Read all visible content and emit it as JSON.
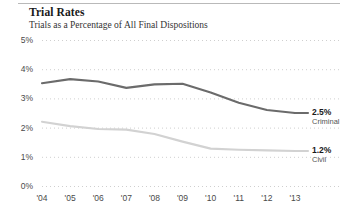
{
  "chart_data": {
    "type": "line",
    "title": "Trial Rates",
    "subtitle": "Trials as a Percentage of All Final Dispositions",
    "xlabel": "",
    "ylabel": "",
    "x": [
      "'04",
      "'05",
      "'06",
      "'07",
      "'08",
      "'09",
      "'10",
      "'11",
      "'12",
      "'13"
    ],
    "categories": [
      "'04",
      "'05",
      "'06",
      "'07",
      "'08",
      "'09",
      "'10",
      "'11",
      "'12",
      "'13"
    ],
    "ylim": [
      0,
      5
    ],
    "yticks": [
      0,
      1,
      2,
      3,
      4,
      5
    ],
    "ytick_labels": [
      "0%",
      "1%",
      "2%",
      "3%",
      "4%",
      "5%"
    ],
    "grid": true,
    "grid_style": "dotted",
    "legend_position": "right-inline",
    "series": [
      {
        "name": "Criminal",
        "color": "#6b6b6b",
        "end_value_label": "2.5%",
        "values": [
          3.52,
          3.66,
          3.58,
          3.36,
          3.48,
          3.5,
          3.2,
          2.85,
          2.6,
          2.5
        ]
      },
      {
        "name": "Civil",
        "color": "#d2d2d2",
        "end_value_label": "1.2%",
        "values": [
          2.2,
          2.05,
          1.95,
          1.93,
          1.78,
          1.52,
          1.28,
          1.24,
          1.22,
          1.2
        ]
      }
    ]
  },
  "annotations": [
    {
      "value": "2.5%",
      "name": "Criminal"
    },
    {
      "value": "1.2%",
      "name": "Civil"
    }
  ],
  "colors": {
    "criminal": "#6b6b6b",
    "civil": "#d2d2d2",
    "grid": "#cfcfcf",
    "text": "#1a1a1a",
    "tick_text": "#4a4a4a",
    "rule": "#b9b9b9"
  }
}
